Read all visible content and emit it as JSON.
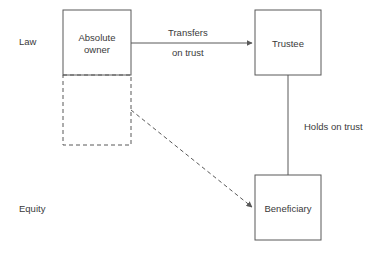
{
  "diagram": {
    "stroke_color": "#595959",
    "text_color": "#3a3a3a",
    "background_color": "#ffffff",
    "bands": [
      {
        "id": "law",
        "label": "Law"
      },
      {
        "id": "equity",
        "label": "Equity"
      }
    ],
    "nodes": [
      {
        "id": "absolute-owner",
        "label": "Absolute\nowner",
        "style": "solid",
        "x": 63,
        "y": 10,
        "w": 68,
        "h": 65
      },
      {
        "id": "absolute-owner-equity",
        "label": "",
        "style": "dashed",
        "x": 63,
        "y": 75,
        "w": 68,
        "h": 70
      },
      {
        "id": "trustee",
        "label": "Trustee",
        "style": "solid",
        "x": 255,
        "y": 10,
        "w": 66,
        "h": 65
      },
      {
        "id": "beneficiary",
        "label": "Beneficiary",
        "style": "solid",
        "x": 255,
        "y": 175,
        "w": 66,
        "h": 65
      }
    ],
    "edges": [
      {
        "id": "transfers-on-trust",
        "from": "absolute-owner",
        "to": "trustee",
        "style": "solid",
        "arrow": true,
        "label_line1": "Transfers",
        "label_line2": "on trust"
      },
      {
        "id": "holds-on-trust",
        "from": "trustee",
        "to": "beneficiary",
        "style": "solid",
        "arrow": false,
        "label_line1": "Holds on trust",
        "label_line2": ""
      },
      {
        "id": "equitable-interest",
        "from": "absolute-owner-equity",
        "to": "beneficiary",
        "style": "dashed",
        "arrow": true,
        "label_line1": "",
        "label_line2": ""
      }
    ]
  }
}
